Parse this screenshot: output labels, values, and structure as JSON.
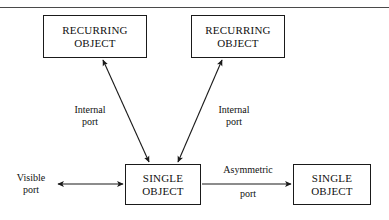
{
  "figure": {
    "top_rule": true,
    "background_color": "#ffffff",
    "line_color": "#1a1a1a"
  },
  "nodes": [
    {
      "id": "recurring-object-left",
      "line1": "RECURRING",
      "line2": "OBJECT"
    },
    {
      "id": "recurring-object-right",
      "line1": "RECURRING",
      "line2": "OBJECT"
    },
    {
      "id": "single-object-center",
      "line1": "SINGLE",
      "line2": "OBJECT"
    },
    {
      "id": "single-object-right",
      "line1": "SINGLE",
      "line2": "OBJECT"
    }
  ],
  "edge_labels": {
    "internal_left": {
      "line1": "Internal",
      "line2": "port"
    },
    "internal_right": {
      "line1": "Internal",
      "line2": "port"
    },
    "visible": {
      "line1": "Visible",
      "line2": "port"
    },
    "asymmetric": {
      "line1": "Asymmetric",
      "line2": "port"
    }
  },
  "edges": [
    {
      "id": "edge-internal-left",
      "from": "single-object-center",
      "to": "recurring-object-left",
      "arrowheads": "both"
    },
    {
      "id": "edge-internal-right",
      "from": "single-object-center",
      "to": "recurring-object-right",
      "arrowheads": "both"
    },
    {
      "id": "edge-visible",
      "from": "visible-port",
      "to": "single-object-center",
      "arrowheads": "both"
    },
    {
      "id": "edge-asymmetric",
      "from": "single-object-center",
      "to": "single-object-right",
      "arrowheads": "forward"
    }
  ]
}
